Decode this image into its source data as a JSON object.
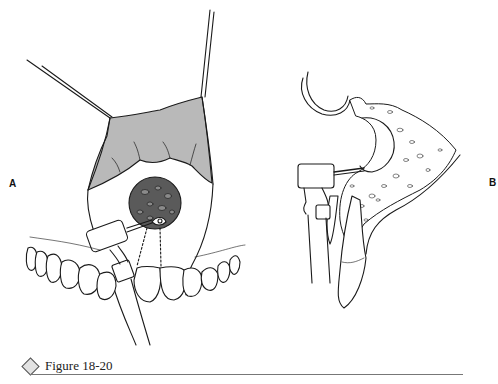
{
  "figure": {
    "caption": "Figure 18-20",
    "panels": [
      {
        "id": "A",
        "label": "A",
        "description": "Frontal view: retracted mucoperiosteal flap over anterior maxilla, circular bony window with bur handpiece, teeth below"
      },
      {
        "id": "B",
        "label": "B",
        "description": "Sagittal section: handpiece with bur entering bone near tooth root apex, cancellous bone pattern"
      }
    ],
    "colors": {
      "line": "#1a1a1a",
      "flap_fill": "#b9b9b9",
      "bone_window_fill": "#5a5a5a",
      "caption_rule": "#777777",
      "background": "#ffffff"
    }
  }
}
